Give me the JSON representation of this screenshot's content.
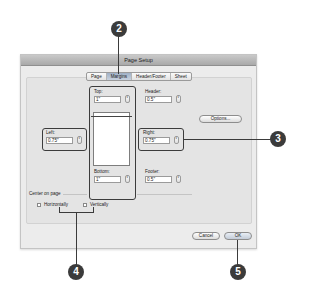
{
  "dialog": {
    "title": "Page Setup",
    "tabs": [
      {
        "label": "Page",
        "active": false
      },
      {
        "label": "Margins",
        "active": true
      },
      {
        "label": "Header/Footer",
        "active": false
      },
      {
        "label": "Sheet",
        "active": false
      }
    ],
    "fields": {
      "top": {
        "label": "Top:",
        "value": "1\""
      },
      "header": {
        "label": "Header:",
        "value": "0.5\""
      },
      "left": {
        "label": "Left:",
        "value": "0.75\""
      },
      "right": {
        "label": "Right:",
        "value": "0.75\""
      },
      "bottom": {
        "label": "Bottom:",
        "value": "1\""
      },
      "footer": {
        "label": "Footer:",
        "value": "0.5\""
      }
    },
    "options_button": "Options...",
    "center_on_page": {
      "label": "Center on page",
      "horizontally": {
        "label": "Horizontally",
        "checked": false
      },
      "vertically": {
        "label": "Vertically",
        "checked": false
      }
    },
    "buttons": {
      "cancel": "Cancel",
      "ok": "OK"
    },
    "stepper_glyph": "⇕"
  },
  "callouts": [
    {
      "number": "2",
      "target": "margins-tab"
    },
    {
      "number": "3",
      "target": "margin-fields"
    },
    {
      "number": "4",
      "target": "center-on-page-checkboxes"
    },
    {
      "number": "5",
      "target": "ok-button"
    }
  ],
  "colors": {
    "callout": "#3b3b3b",
    "dialog_bg": "#ececec",
    "titlebar": "#b5b5b5",
    "active_tab": "#b3c0d2"
  }
}
